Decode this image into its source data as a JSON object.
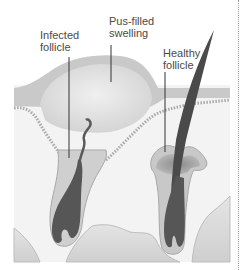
{
  "diagram": {
    "labels": {
      "infected": {
        "line1": "Infected",
        "line2": "follicle"
      },
      "pus": {
        "line1": "Pus-filled",
        "line2": "swelling"
      },
      "healthy": {
        "line1": "Healthy",
        "line2": "follicle"
      }
    },
    "colors": {
      "epidermis": "#c8c8c8",
      "swelling": "#dcdcdc",
      "dermis": "#f2f2f2",
      "fat": "#d6d6d6",
      "follicle_dark": "#555555",
      "leader_line": "#333333",
      "text": "#4a4a4a"
    }
  }
}
